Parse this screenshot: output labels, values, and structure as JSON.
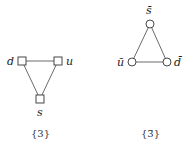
{
  "diagrams": [
    {
      "caption": "{3}",
      "node_shape": "square",
      "nodes": [
        {
          "label": "d",
          "x": 22,
          "y": 61
        },
        {
          "label": "u",
          "x": 58,
          "y": 61
        },
        {
          "label": "s",
          "x": 40,
          "y": 99
        }
      ]
    },
    {
      "caption": "{3̄}",
      "node_shape": "circle",
      "nodes": [
        {
          "label": "s̄",
          "x": 150,
          "y": 24
        },
        {
          "label": "ū",
          "x": 132,
          "y": 62
        },
        {
          "label": "d̄",
          "x": 167,
          "y": 62
        }
      ]
    }
  ]
}
